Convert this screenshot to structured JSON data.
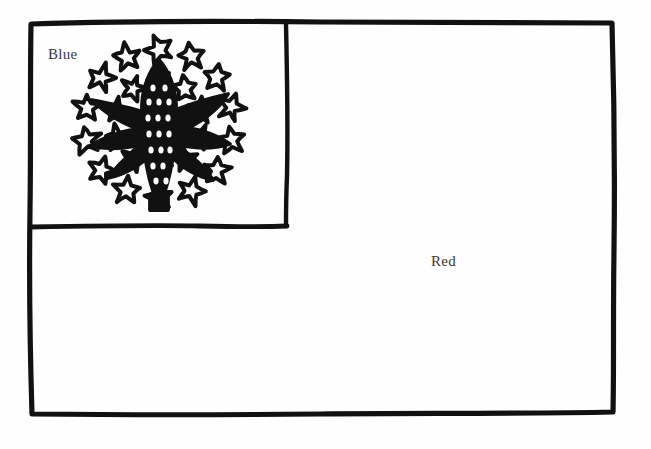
{
  "page": {
    "type": "coloring-page",
    "width": 651,
    "height": 449,
    "background_color": "#fefefe",
    "ink_color": "#111111"
  },
  "flag": {
    "outer_border": {
      "name": "flag-outline",
      "x": 30,
      "y": 22,
      "width": 584,
      "height": 392,
      "stroke_width": 5,
      "hand_drawn": true
    },
    "canton": {
      "name": "canton",
      "label": "Blue",
      "color_name": "Blue",
      "color_hex": "#0039a6",
      "x": 30,
      "y": 22,
      "width": 257,
      "height": 204,
      "stroke_width": 4
    },
    "field": {
      "name": "field",
      "label": "Red",
      "color_name": "Red",
      "color_hex": "#d52b1e"
    }
  },
  "labels": {
    "blue": "Blue",
    "red": "Red"
  },
  "emblem": {
    "name": "corn-and-stars-emblem",
    "center_x": 159,
    "center_y": 124,
    "description": "ear of maize with leaves encircled by two concentric rings of five-pointed stars",
    "stroke_width": 4,
    "corn": {
      "name": "corn-ear",
      "kernel_rows": 6,
      "kernel_columns": 5,
      "leaf_count": 6,
      "height": 108,
      "width": 38
    },
    "inner_ring": {
      "name": "inner-star-ring",
      "star_count": 10,
      "radius": 44,
      "star_size": 26,
      "start_angle": -90
    },
    "outer_ring": {
      "name": "outer-star-ring",
      "star_count": 14,
      "radius": 74,
      "star_size": 29,
      "start_angle": -90
    },
    "total_stars": 24
  }
}
